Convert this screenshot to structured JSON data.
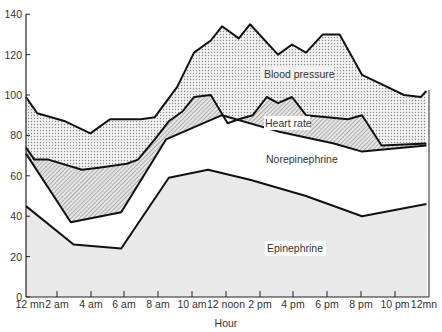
{
  "chart_data": {
    "type": "area",
    "title": "",
    "xlabel": "Hour",
    "ylabel": "",
    "ylim": [
      0,
      140
    ],
    "yticks": [
      0,
      20,
      40,
      60,
      80,
      100,
      120,
      140
    ],
    "xticks": [
      "12 mn",
      "2 am",
      "4 am",
      "6 am",
      "8 am",
      "10 am",
      "12 noon",
      "2 pm",
      "4 pm",
      "6 pm",
      "8 pm",
      "10 pm",
      "12mn"
    ],
    "grid": false,
    "legend": "inline labels",
    "series": [
      {
        "name": "Blood pressure",
        "fill": "dotted",
        "points": [
          [
            0,
            99
          ],
          [
            0.4,
            91
          ],
          [
            1.4,
            87
          ],
          [
            2.3,
            81
          ],
          [
            3.0,
            88
          ],
          [
            4.1,
            88
          ],
          [
            4.6,
            89
          ],
          [
            5.4,
            104
          ],
          [
            6.0,
            121
          ],
          [
            6.6,
            127
          ],
          [
            7.0,
            134
          ],
          [
            7.6,
            128
          ],
          [
            8.0,
            135
          ],
          [
            9.0,
            120
          ],
          [
            9.5,
            125
          ],
          [
            10.0,
            121
          ],
          [
            10.6,
            130
          ],
          [
            11.2,
            130
          ],
          [
            12.0,
            110
          ],
          [
            12.6,
            106
          ],
          [
            13.5,
            100
          ],
          [
            14.1,
            99
          ],
          [
            14.3,
            102
          ]
        ]
      },
      {
        "name": "Heart rate",
        "fill": "hatched",
        "points": [
          [
            0,
            74
          ],
          [
            0.3,
            68
          ],
          [
            0.8,
            68
          ],
          [
            2.0,
            63
          ],
          [
            2.6,
            64
          ],
          [
            3.6,
            66
          ],
          [
            4.0,
            68
          ],
          [
            4.6,
            78
          ],
          [
            5.1,
            87
          ],
          [
            5.6,
            92
          ],
          [
            6.0,
            99
          ],
          [
            6.6,
            100
          ],
          [
            7.2,
            86
          ],
          [
            7.6,
            88
          ],
          [
            8.1,
            90
          ],
          [
            8.6,
            99
          ],
          [
            9.0,
            96
          ],
          [
            9.5,
            99
          ],
          [
            10.0,
            90
          ],
          [
            11.5,
            88
          ],
          [
            12.0,
            90
          ],
          [
            12.7,
            75
          ],
          [
            14.3,
            76
          ]
        ]
      },
      {
        "name": "Norepinephrine",
        "fill": "white",
        "points": [
          [
            0,
            71
          ],
          [
            1.6,
            37
          ],
          [
            3.4,
            42
          ],
          [
            5.0,
            78
          ],
          [
            7.0,
            90
          ],
          [
            9.0,
            82
          ],
          [
            11.0,
            76
          ],
          [
            12.0,
            72
          ],
          [
            14.3,
            75
          ]
        ]
      },
      {
        "name": "Epinephrine",
        "fill": "light-gray",
        "points": [
          [
            0,
            45
          ],
          [
            1.7,
            26
          ],
          [
            3.4,
            24
          ],
          [
            5.1,
            59
          ],
          [
            6.5,
            63
          ],
          [
            8.0,
            58
          ],
          [
            10.0,
            50
          ],
          [
            12.0,
            40
          ],
          [
            14.3,
            46
          ]
        ]
      }
    ],
    "annotations": [
      "Blood pressure",
      "Heart rate",
      "Norepinephrine",
      "Epinephrine"
    ]
  },
  "labels": {
    "bp": "Blood pressure",
    "hr": "Heart rate",
    "ne": "Norepinephrine",
    "epi": "Epinephrine",
    "xaxis": "Hour"
  }
}
